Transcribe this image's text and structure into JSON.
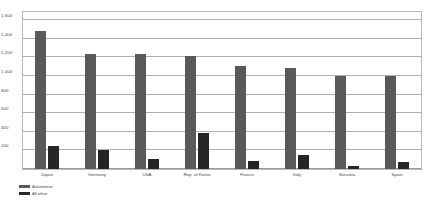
{
  "chart_data": {
    "type": "bar",
    "title": "",
    "subtitle": "",
    "xlabel": "",
    "ylabel": "",
    "ylim": [
      0,
      1600
    ],
    "ytick_labels": [
      "1,600",
      "1,400",
      "1,200",
      "1,000",
      "800",
      "600",
      "400",
      "200",
      "0"
    ],
    "ytick_values": [
      1600,
      1400,
      1200,
      1000,
      800,
      600,
      400,
      200,
      0
    ],
    "grid": true,
    "legend_position": "bottom-left",
    "categories": [
      "Japan",
      "Germany",
      "USA",
      "Rep. of Korea",
      "France",
      "Italy",
      "Slovakia",
      "Spain"
    ],
    "series": [
      {
        "name": "Automotive",
        "color": "#595959",
        "values": [
          1480,
          1230,
          1230,
          1215,
          1110,
          1085,
          1000,
          1000
        ]
      },
      {
        "name": "All other",
        "color": "#262626",
        "values": [
          250,
          200,
          105,
          390,
          90,
          150,
          30,
          80
        ]
      }
    ]
  },
  "legend": {
    "items": [
      {
        "label": "Automotive",
        "swatch": "automotive"
      },
      {
        "label": "All other",
        "swatch": "allother"
      }
    ]
  },
  "colors": {
    "automotive": "#595959",
    "all_other": "#262626",
    "gridline": "#b0b0b0",
    "frame": "#b8b8b8",
    "text": "#4a4a4a",
    "background": "#ffffff"
  }
}
